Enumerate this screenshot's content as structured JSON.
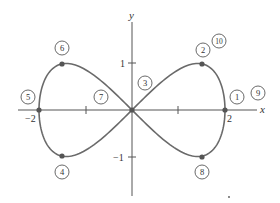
{
  "figure": {
    "axes": {
      "x_label": "x",
      "y_label": "y",
      "x_ticks": [
        {
          "value": -2,
          "label": "−2"
        },
        {
          "value": -1,
          "label": ""
        },
        {
          "value": 1,
          "label": ""
        },
        {
          "value": 2,
          "label": "2"
        }
      ],
      "y_ticks": [
        {
          "value": 1,
          "label": "1"
        },
        {
          "value": -1,
          "label": "−1"
        }
      ]
    },
    "curve": {
      "description": "figure-eight curve x = 2 sin t, y = sin 2t",
      "color": "#6a6a6a"
    },
    "marked_points": [
      {
        "x": 2,
        "y": 0
      },
      {
        "x": 1.41,
        "y": 1
      },
      {
        "x": 0,
        "y": 0
      },
      {
        "x": -1.41,
        "y": -1
      },
      {
        "x": -2,
        "y": 0
      },
      {
        "x": -1.41,
        "y": 1
      },
      {
        "x": 1.41,
        "y": -1
      }
    ],
    "circled_labels": [
      {
        "id": "1",
        "text": "1"
      },
      {
        "id": "2",
        "text": "2"
      },
      {
        "id": "3",
        "text": "3"
      },
      {
        "id": "4",
        "text": "4"
      },
      {
        "id": "5",
        "text": "5"
      },
      {
        "id": "6",
        "text": "6"
      },
      {
        "id": "7",
        "text": "7"
      },
      {
        "id": "8",
        "text": "8"
      },
      {
        "id": "9",
        "text": "9"
      },
      {
        "id": "10",
        "text": "10"
      }
    ]
  }
}
